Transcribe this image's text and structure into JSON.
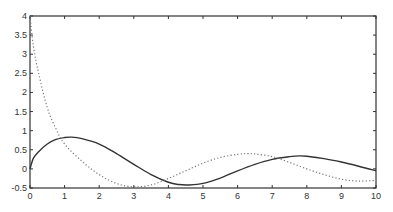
{
  "chart_data": {
    "type": "line",
    "title": "",
    "xlabel": "",
    "ylabel": "",
    "xlim": [
      0,
      10
    ],
    "ylim": [
      -0.5,
      4
    ],
    "grid": false,
    "legend": null,
    "xticks": [
      0,
      1,
      2,
      3,
      4,
      5,
      6,
      7,
      8,
      9,
      10
    ],
    "yticks": [
      -0.5,
      0,
      0.5,
      1,
      1.5,
      2,
      2.5,
      3,
      3.5,
      4
    ],
    "xtick_labels": [
      "0",
      "1",
      "2",
      "3",
      "4",
      "5",
      "6",
      "7",
      "8",
      "9",
      "10"
    ],
    "ytick_labels": [
      "-0.5",
      "0",
      "0.5",
      "1",
      "1.5",
      "2",
      "2.5",
      "3",
      "3.5",
      "4"
    ],
    "series": [
      {
        "name": "solid",
        "style": "solid",
        "color": "#333333",
        "x": [
          0,
          0.1,
          0.25,
          0.5,
          0.75,
          1,
          1.2,
          1.5,
          2,
          2.5,
          3,
          3.5,
          4,
          4.3,
          4.6,
          5,
          5.5,
          6,
          6.5,
          7,
          7.5,
          7.8,
          8,
          8.5,
          9,
          9.5,
          10
        ],
        "values": [
          0,
          0.28,
          0.45,
          0.65,
          0.77,
          0.82,
          0.83,
          0.79,
          0.65,
          0.4,
          0.12,
          -0.15,
          -0.35,
          -0.41,
          -0.42,
          -0.38,
          -0.24,
          -0.05,
          0.12,
          0.25,
          0.32,
          0.34,
          0.33,
          0.27,
          0.18,
          0.07,
          -0.05
        ]
      },
      {
        "name": "dotted",
        "style": "dotted",
        "color": "#777777",
        "x": [
          0,
          0.1,
          0.25,
          0.5,
          0.75,
          1,
          1.5,
          2,
          2.5,
          3,
          3.5,
          4,
          4.5,
          5,
          5.5,
          6,
          6.3,
          6.5,
          7,
          7.5,
          8,
          8.5,
          9,
          9.5,
          10
        ],
        "values": [
          4,
          3.2,
          2.5,
          1.6,
          1.05,
          0.65,
          0.2,
          -0.15,
          -0.38,
          -0.47,
          -0.42,
          -0.25,
          -0.05,
          0.15,
          0.3,
          0.38,
          0.4,
          0.39,
          0.32,
          0.17,
          0.0,
          -0.15,
          -0.27,
          -0.32,
          -0.3
        ]
      }
    ]
  },
  "axes_px": {
    "left": 30,
    "right": 376,
    "top": 16,
    "bottom": 188
  }
}
